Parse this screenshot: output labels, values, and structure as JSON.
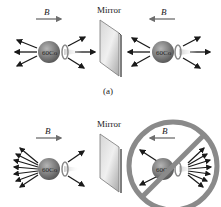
{
  "panel_a": {
    "mirror_label": "Mirror",
    "field_label": "B",
    "nucleus_label": "60Co",
    "caption": "(a)",
    "left_field_direction": "right",
    "right_field_direction": "left"
  },
  "panel_b": {
    "mirror_label": "Mirror",
    "field_label": "B",
    "nucleus_label": "60Co",
    "left_field_direction": "right",
    "right_field_direction": "left",
    "forbidden_symbol": "prohibited-circle"
  },
  "colors": {
    "arrow": "#1a1a1a",
    "field_arrow": "#6e6e6e",
    "nucleus": "#7a7a7a",
    "mirror": "#b8b8b8",
    "forbidden": "#8a8a8a"
  }
}
